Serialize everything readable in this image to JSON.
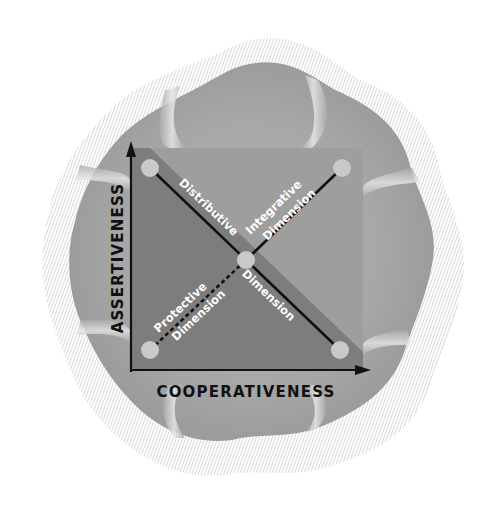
{
  "diagram": {
    "axes": {
      "x_label": "COOPERATIVENESS",
      "y_label": "ASSERTIVENESS"
    },
    "dimensions": [
      {
        "id": "distributive",
        "line1": "Distributive",
        "line2": "Dimension",
        "style": "solid"
      },
      {
        "id": "integrative",
        "line1": "Integrative",
        "line2": "Dimension",
        "style": "solid"
      },
      {
        "id": "protective",
        "line1": "Protective",
        "line2": "Dimension",
        "style": "dashed"
      }
    ],
    "nodes": [
      {
        "id": "top-left",
        "cx": 150,
        "cy": 168
      },
      {
        "id": "top-right",
        "cx": 342,
        "cy": 168
      },
      {
        "id": "bottom-left",
        "cx": 150,
        "cy": 350
      },
      {
        "id": "bottom-right",
        "cx": 340,
        "cy": 350
      },
      {
        "id": "center",
        "cx": 246,
        "cy": 260
      }
    ],
    "colors": {
      "blob_fill": "#a9a9a9",
      "blob_light": "#c4c4c4",
      "hatch": "#bdbdbd",
      "square_upper": "#9e9e9e",
      "square_lower": "#7d7d7d",
      "node_fill": "#c9c9c9",
      "line": "#111111",
      "dim_text": "#ffffff"
    }
  }
}
